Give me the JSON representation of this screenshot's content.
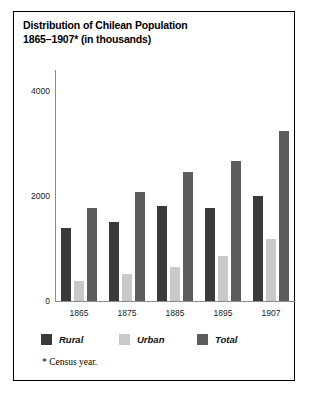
{
  "figure": {
    "title_line1": "Distribution of Chilean Population",
    "title_line2": "1865–1907* (in thousands)",
    "footnote": "* Census year."
  },
  "legend": {
    "entries": [
      {
        "label": "Rural",
        "color": "#3a3a3a"
      },
      {
        "label": "Urban",
        "color": "#c9c9c9"
      },
      {
        "label": "Total",
        "color": "#5d5d5d"
      }
    ]
  },
  "axes": {
    "y_ticks": [
      "0",
      "2000",
      "4000"
    ],
    "x_ticks": [
      "1865",
      "1875",
      "1885",
      "1895",
      "1907"
    ]
  },
  "chart_data": {
    "type": "bar",
    "title": "Distribution of Chilean Population 1865–1907* (in thousands)",
    "subtitle": "",
    "xlabel": "",
    "ylabel": "",
    "ylim": [
      0,
      4400
    ],
    "yticks": [
      0,
      2000,
      4000
    ],
    "ytick_labels": [
      "0",
      "2000",
      "4000"
    ],
    "grid": false,
    "legend_position": "below-axes",
    "units": "thousands",
    "note": "* Census year.",
    "categories": [
      "1865",
      "1875",
      "1885",
      "1895",
      "1907"
    ],
    "series": [
      {
        "name": "Rural",
        "color": "#3a3a3a",
        "values": [
          1380,
          1500,
          1800,
          1760,
          2000
        ]
      },
      {
        "name": "Urban",
        "color": "#c9c9c9",
        "values": [
          370,
          510,
          640,
          855,
          1180
        ]
      },
      {
        "name": "Total",
        "color": "#5d5d5d",
        "values": [
          1760,
          2070,
          2450,
          2660,
          3240
        ]
      }
    ]
  }
}
